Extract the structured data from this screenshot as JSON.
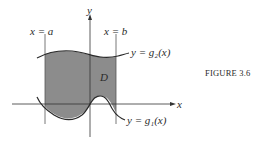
{
  "figure": {
    "caption": "FIGURE 3.6",
    "labels": {
      "x_eq_a": "x = a",
      "x_eq_b": "x = b",
      "y_axis": "y",
      "x_axis": "x",
      "region": "D",
      "upper_curve": "y = g₂(x)",
      "lower_curve": "y = g₁(x)"
    },
    "colors": {
      "region_fill": "#8c8c8c",
      "line": "#2a2a2a"
    }
  }
}
